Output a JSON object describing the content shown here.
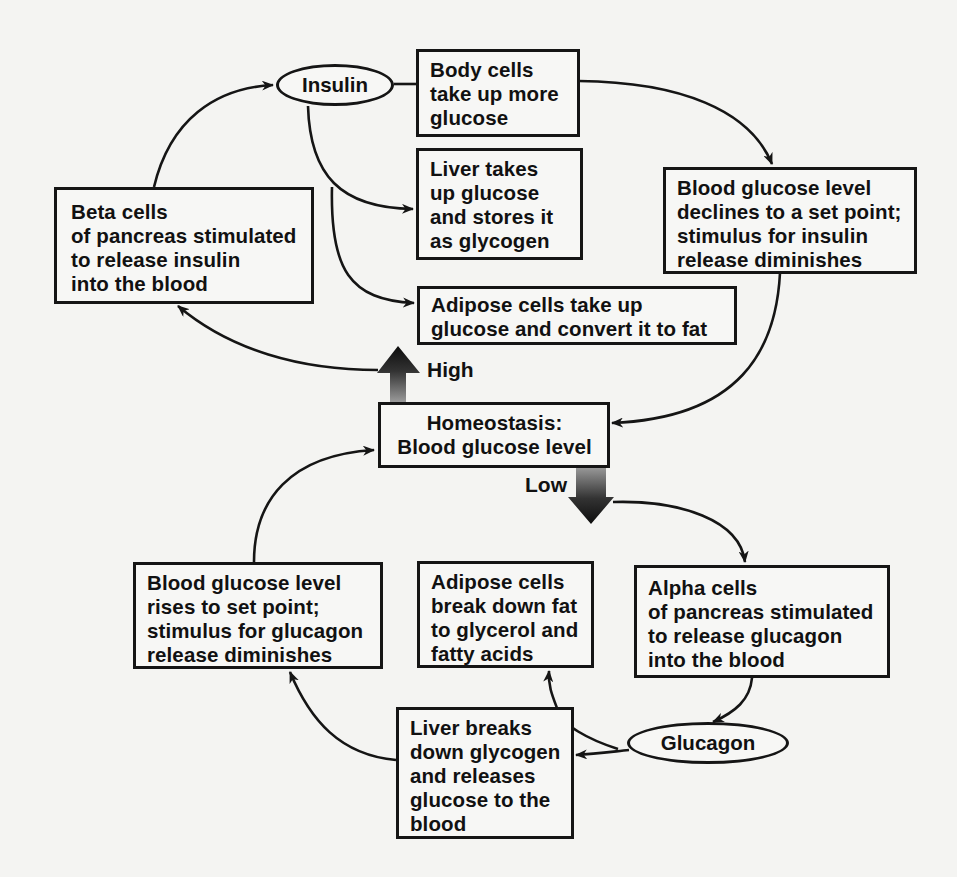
{
  "diagram": {
    "center": {
      "text": "Homeostasis:\nBlood glucose level"
    },
    "signals": {
      "high": "High",
      "low": "Low"
    },
    "hormones": {
      "insulin": "Insulin",
      "glucagon": "Glucagon"
    },
    "high_pathway": {
      "beta_cells": "Beta cells\nof pancreas stimulated\nto release insulin\ninto the blood",
      "body_cells": "Body cells\ntake up more\nglucose",
      "liver_takes": "Liver takes\nup glucose\nand stores it\nas glycogen",
      "adipose_take": "Adipose cells take up\nglucose and convert it to fat",
      "declines": "Blood glucose level\ndeclines to a set point;\nstimulus for insulin\nrelease diminishes"
    },
    "low_pathway": {
      "alpha_cells": "Alpha cells\nof pancreas stimulated\nto release glucagon\ninto the blood",
      "liver_breaks": "Liver breaks\ndown glycogen\nand releases\nglucose to the\nblood",
      "adipose_break": "Adipose  cells\nbreak down fat\nto glycerol and\nfatty acids",
      "rises": "Blood glucose level\nrises to set point;\nstimulus for glucagon\nrelease diminishes"
    },
    "colors": {
      "line": "#151515",
      "background": "#f4f4f2",
      "arrow_dark": "#111111",
      "arrow_light": "#8a8a8a"
    }
  }
}
